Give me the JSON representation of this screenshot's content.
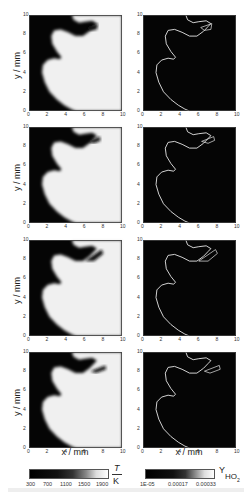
{
  "figure": {
    "rows": 4,
    "columns": [
      "temperature",
      "ho2_mass_fraction"
    ],
    "axes": {
      "x_label": "x / mm",
      "y_label": "y / mm",
      "x_ticks": [
        "0",
        "2",
        "4",
        "6",
        "8",
        "10"
      ],
      "y_ticks": [
        "0",
        "2",
        "4",
        "6",
        "8",
        "10"
      ]
    },
    "colorbars": {
      "temperature": {
        "ticks": [
          "300",
          "700",
          "1100",
          "1500",
          "1900"
        ],
        "unit_numerator": "T",
        "unit_denominator": "K",
        "colors": [
          "#000000",
          "#ffffff"
        ]
      },
      "ho2": {
        "ticks": [
          "1E-05",
          "0.00017",
          "0.00033"
        ],
        "unit_symbol": "Y",
        "unit_subscript": "HO",
        "unit_subscript2": "2",
        "colors": [
          "#000000",
          "#ffffff"
        ]
      }
    },
    "colors": {
      "hot_region": "#f2f2f2",
      "cold_region": "#050505",
      "flame_line": "#e8e8e8",
      "background": "#ffffff"
    }
  }
}
